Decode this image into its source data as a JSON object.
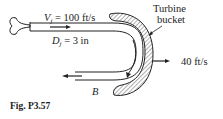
{
  "figure": {
    "caption": "Fig. P3.57",
    "labels": {
      "jet_velocity_var": "V",
      "jet_velocity_sub": "j",
      "jet_velocity_value": " = 100 ft/s",
      "jet_diameter_var": "D",
      "jet_diameter_sub": "j",
      "jet_diameter_value": " = 3 in",
      "bucket_line1": "Turbine",
      "bucket_line2": "bucket",
      "bucket_velocity": "40 ft/s",
      "point_b": "B"
    }
  }
}
